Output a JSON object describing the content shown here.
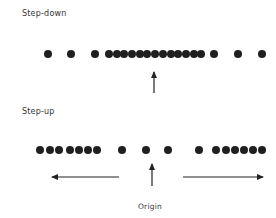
{
  "diagram": {
    "panels": [
      {
        "label": "Step-down",
        "row_y": 54,
        "dots_x": [
          48,
          71,
          95,
          109,
          117,
          124,
          132,
          140,
          147,
          155,
          163,
          171,
          178,
          186,
          194,
          201,
          214,
          238,
          262
        ],
        "arrow": {
          "x": 154,
          "tip_y": 72,
          "base_y": 93
        }
      },
      {
        "label": "Step-up",
        "row_y": 150,
        "dots_x": [
          40,
          50,
          59,
          70,
          79,
          88,
          97,
          122,
          146,
          168,
          199,
          216,
          226,
          235,
          244,
          253,
          262
        ],
        "arrow": {
          "x": 152,
          "tip_y": 164,
          "base_y": 186
        },
        "left_arrow": {
          "from_x": 119,
          "to_x": 52,
          "y": 177
        },
        "right_arrow": {
          "from_x": 183,
          "to_x": 263,
          "y": 177
        },
        "origin_label": "Origin"
      }
    ],
    "colors": {
      "dot": "#1f1f1f",
      "line": "#222222",
      "text": "#333333"
    }
  }
}
